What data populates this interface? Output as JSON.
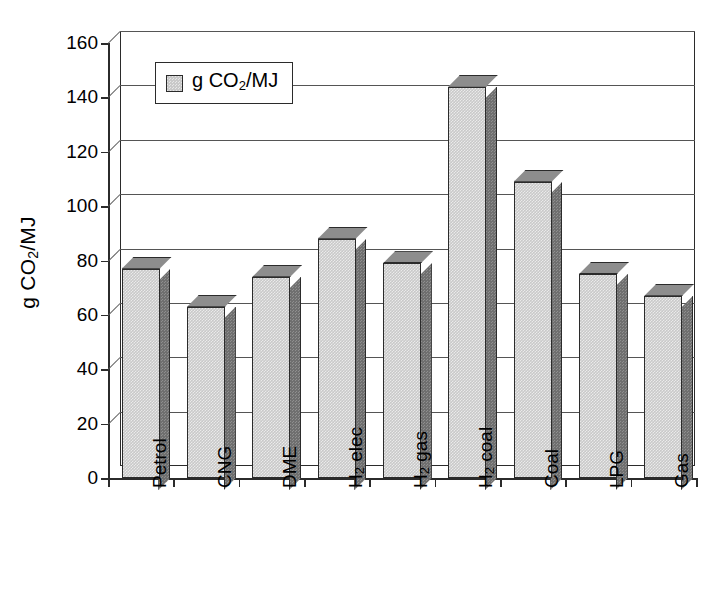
{
  "chart_data": {
    "type": "bar",
    "title": "",
    "xlabel": "",
    "ylabel": "g CO2/MJ",
    "ylabel_parts": {
      "prefix": "g CO",
      "sub": "2",
      "suffix": "/MJ"
    },
    "categories": [
      "Petrol",
      "CNG",
      "DME",
      "H2 elec",
      "H2 gas",
      "H2 coal",
      "Coal",
      "LPG",
      "Gas"
    ],
    "category_parts": [
      {
        "prefix": "Petrol",
        "sub": "",
        "suffix": ""
      },
      {
        "prefix": "CNG",
        "sub": "",
        "suffix": ""
      },
      {
        "prefix": "DME",
        "sub": "",
        "suffix": ""
      },
      {
        "prefix": "H",
        "sub": "2",
        "suffix": " elec"
      },
      {
        "prefix": "H",
        "sub": "2",
        "suffix": " gas"
      },
      {
        "prefix": "H",
        "sub": "2",
        "suffix": " coal"
      },
      {
        "prefix": "Coal",
        "sub": "",
        "suffix": ""
      },
      {
        "prefix": "LPG",
        "sub": "",
        "suffix": ""
      },
      {
        "prefix": "Gas",
        "sub": "",
        "suffix": ""
      }
    ],
    "values": [
      77,
      63,
      74,
      88,
      79,
      144,
      109,
      75,
      67
    ],
    "series": [
      {
        "name": "g CO2/MJ",
        "values": [
          77,
          63,
          74,
          88,
          79,
          144,
          109,
          75,
          67
        ]
      }
    ],
    "ylim": [
      0,
      160
    ],
    "ytick_labels": [
      "0",
      "20",
      "40",
      "60",
      "80",
      "100",
      "120",
      "140",
      "160"
    ],
    "ytick_values": [
      0,
      20,
      40,
      60,
      80,
      100,
      120,
      140,
      160
    ],
    "grid": true,
    "legend_position": "upper-left-inside",
    "style_3d": true,
    "colors": {
      "bar_front": "#c9c9c9",
      "bar_side": "#6f6f6f",
      "bar_top": "#8d8d8d",
      "axis": "#2b2b2b",
      "gridline": "#555555",
      "background": "#ffffff"
    }
  },
  "legend": {
    "label": "g CO2/MJ",
    "label_parts": {
      "prefix": "g CO",
      "sub": "2",
      "suffix": "/MJ"
    }
  }
}
